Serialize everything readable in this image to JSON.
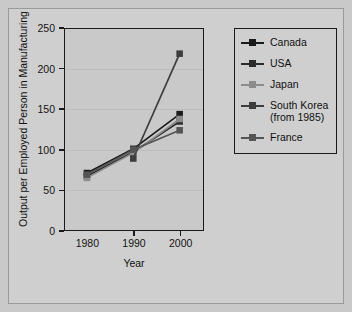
{
  "chart_data": {
    "type": "line",
    "title": "",
    "xlabel": "Year",
    "ylabel": "Output per Employed Person in Manufacturing",
    "x": [
      1980,
      1990,
      2000
    ],
    "xticklabels": [
      "1980",
      "1990",
      "2000"
    ],
    "yticklabels": [
      "0",
      "50",
      "100",
      "150",
      "200",
      "250"
    ],
    "yticks": [
      0,
      50,
      100,
      150,
      200,
      250
    ],
    "ylim": [
      0,
      250
    ],
    "xlim": [
      1975,
      2005
    ],
    "grid": true,
    "legend_position": "right-outside",
    "series": [
      {
        "name": "Canada",
        "label": "Canada",
        "color": "#1a1a1a",
        "values": [
          70,
          100,
          143
        ]
      },
      {
        "name": "USA",
        "label": "USA",
        "color": "#2b2b2b",
        "values": [
          66,
          96,
          134
        ]
      },
      {
        "name": "Japan",
        "label": "Japan",
        "color": "#8c8c8c",
        "values": [
          64,
          95,
          137
        ]
      },
      {
        "name": "SouthKorea",
        "label": "South Korea\n(from 1985)",
        "color": "#3d3d3d",
        "values": [
          null,
          88,
          218
        ]
      },
      {
        "name": "France",
        "label": "France",
        "color": "#555555",
        "values": [
          68,
          99,
          123
        ]
      }
    ]
  },
  "legend": {
    "items": [
      {
        "label": "Canada"
      },
      {
        "label": "USA"
      },
      {
        "label": "Japan"
      },
      {
        "label": "South Korea\n(from 1985)"
      },
      {
        "label": "France"
      }
    ]
  },
  "axes": {
    "y_title": "Output per Employed Person in Manufacturing",
    "x_title": "Year"
  },
  "colors": {
    "figure_background": "#cfcfcf",
    "plot_background": "#c9c9c9",
    "axis": "#1a1a1a",
    "grid": "#bdbdbd"
  }
}
